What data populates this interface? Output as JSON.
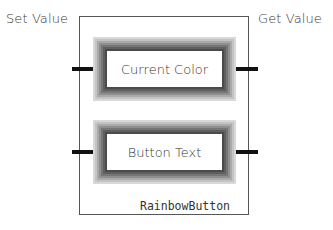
{
  "diagram": {
    "left_label": "Set Value",
    "right_label": "Get Value",
    "class_name": "RainbowButton",
    "ports": [
      {
        "label": "Current Color"
      },
      {
        "label": "Button Text"
      }
    ]
  },
  "colors": {
    "border": "#555555",
    "connector": "#111111",
    "glow_dark": "#4a4a4a",
    "glow_light": "#d8d8d8",
    "background": "#ffffff"
  }
}
